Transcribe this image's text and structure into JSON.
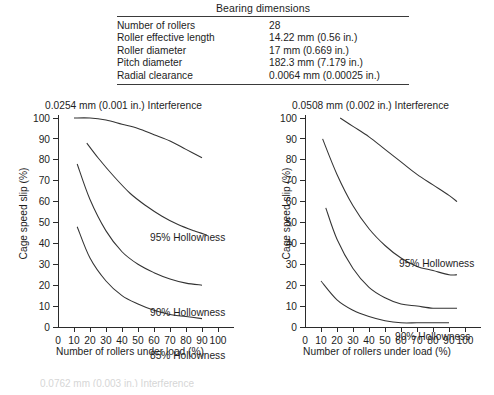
{
  "table": {
    "title": "Bearing dimensions",
    "rows": [
      {
        "label": "Number of rollers",
        "value": "28"
      },
      {
        "label": "Roller effective length",
        "value": "14.22 mm (0.56 in.)"
      },
      {
        "label": "Roller diameter",
        "value": "17 mm (0.669 in.)"
      },
      {
        "label": "Pitch diameter",
        "value": "182.3 mm (7.179 in.)"
      },
      {
        "label": "Radial clearance",
        "value": "0.0064 mm (0.00025 in.)"
      }
    ]
  },
  "bottom_caption": "0.0762 mm (0.003 in.) Interference",
  "chart_data": [
    {
      "type": "line",
      "title": "0.0254 mm (0.001 in.) Interference",
      "xlabel": "Number of rollers under load (%)",
      "ylabel": "Cage speed slip (%)",
      "xlim": [
        0,
        110
      ],
      "ylim": [
        0,
        100
      ],
      "xticks": [
        0,
        10,
        20,
        30,
        40,
        50,
        60,
        70,
        80,
        90,
        100
      ],
      "yticks": [
        0,
        10,
        20,
        30,
        40,
        50,
        60,
        70,
        80,
        90,
        100
      ],
      "grid": false,
      "legend_position": "inline-annotations",
      "series": [
        {
          "name": "95% Hollowness",
          "label": "95% Hollowness",
          "x": [
            10,
            20,
            30,
            40,
            50,
            60,
            70,
            80,
            90
          ],
          "y": [
            100,
            100,
            99,
            97,
            95,
            92,
            89,
            85,
            81
          ]
        },
        {
          "name": "90% Hollowness",
          "label": "90% Hollowness",
          "x": [
            18,
            25,
            35,
            45,
            55,
            65,
            75,
            85,
            93
          ],
          "y": [
            88,
            81,
            72,
            64,
            58,
            53,
            49,
            46,
            44
          ]
        },
        {
          "name": "85% Hollowness",
          "label": "85% Hollowness",
          "x": [
            12,
            20,
            30,
            40,
            50,
            60,
            70,
            80,
            90
          ],
          "y": [
            78,
            61,
            46,
            36,
            30,
            26,
            23,
            21,
            20
          ]
        },
        {
          "name": "80% Hollowness",
          "label": "80% Hollowness",
          "x": [
            12,
            20,
            30,
            40,
            50,
            60,
            70,
            80,
            90
          ],
          "y": [
            48,
            33,
            22,
            15,
            11,
            8,
            6,
            5,
            4
          ]
        }
      ]
    },
    {
      "type": "line",
      "title": "0.0508 mm (0.002 in.) Interference",
      "xlabel": "Number of rollers under load (%)",
      "ylabel": "Cage speed slip (%)",
      "xlim": [
        0,
        110
      ],
      "ylim": [
        0,
        100
      ],
      "xticks": [
        0,
        10,
        20,
        30,
        40,
        50,
        60,
        70,
        80,
        90,
        100
      ],
      "yticks": [
        0,
        10,
        20,
        30,
        40,
        50,
        60,
        70,
        80,
        90,
        100
      ],
      "grid": false,
      "legend_position": "inline-annotations",
      "series": [
        {
          "name": "95% Hollowness",
          "label": "95% Hollowness",
          "x": [
            22,
            30,
            40,
            50,
            60,
            70,
            80,
            90,
            95
          ],
          "y": [
            100,
            96,
            91,
            85,
            79,
            73,
            68,
            63,
            60
          ]
        },
        {
          "name": "90% Hollowness",
          "label": "90% Hollowness",
          "x": [
            11,
            20,
            30,
            40,
            50,
            60,
            70,
            80,
            90,
            95
          ],
          "y": [
            90,
            73,
            58,
            47,
            39,
            33,
            29,
            27,
            25,
            25
          ]
        },
        {
          "name": "85% Hollowness",
          "label": "85% Hollowness",
          "x": [
            13,
            20,
            30,
            40,
            50,
            60,
            70,
            80,
            90,
            95
          ],
          "y": [
            57,
            42,
            28,
            19,
            14,
            11,
            10,
            9,
            9,
            9
          ]
        },
        {
          "name": "80% Hollowness",
          "label": "80% Hollowness",
          "x": [
            10,
            20,
            30,
            40,
            50,
            60,
            70,
            80,
            90
          ],
          "y": [
            22,
            13,
            8,
            5,
            3,
            2,
            2,
            2,
            2
          ]
        }
      ]
    }
  ]
}
